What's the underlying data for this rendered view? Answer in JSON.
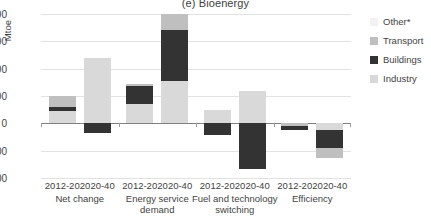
{
  "chart_data": {
    "type": "bar",
    "title": "(e) Bioenergy",
    "subtitle": "",
    "xlabel": "",
    "ylabel": "Mtoe",
    "ylim": [
      -200,
      400
    ],
    "yticks": [
      400,
      300,
      200,
      100,
      0,
      -100,
      -200
    ],
    "ytick_labels": [
      "400",
      "300",
      "200",
      "100",
      "0",
      "-100",
      "-200"
    ],
    "grid": true,
    "stacked": true,
    "legend_position": "right",
    "legend": [
      "Other*",
      "Transport",
      "Buildings",
      "Industry"
    ],
    "colors": {
      "Other*": "#f2f2f2",
      "Transport": "#bfbfbf",
      "Buildings": "#333333",
      "Industry": "#d9d9d9"
    },
    "groups": [
      {
        "label": "Net change",
        "periods": [
          "2012-20",
          "2020-40"
        ]
      },
      {
        "label": "Energy service demand",
        "periods": [
          "2012-20",
          "2020-40"
        ]
      },
      {
        "label": "Fuel and technology switching",
        "periods": [
          "2012-20",
          "2020-40"
        ]
      },
      {
        "label": "Efficiency",
        "periods": [
          "2012-20",
          "2020-40"
        ]
      }
    ],
    "categories": [
      "Net change 2012-20",
      "Net change 2020-40",
      "Energy service demand 2012-20",
      "Energy service demand 2020-40",
      "Fuel and technology switching 2012-20",
      "Fuel and technology switching 2020-40",
      "Efficiency 2012-20",
      "Efficiency 2020-40"
    ],
    "series": [
      {
        "name": "Industry",
        "values": [
          48,
          230,
          70,
          155,
          50,
          120,
          0,
          -25
        ]
      },
      {
        "name": "Buildings",
        "values": [
          15,
          -35,
          70,
          185,
          -40,
          -165,
          -25,
          -65
        ]
      },
      {
        "name": "Transport",
        "values": [
          37,
          10,
          0,
          60,
          0,
          0,
          0,
          -35
        ]
      },
      {
        "name": "Other*",
        "values": [
          0,
          0,
          0,
          0,
          0,
          0,
          0,
          0
        ]
      }
    ],
    "bar_segments": [
      {
        "category": "Net change 2012-20",
        "segments": [
          {
            "series": "Industry",
            "from": 0,
            "to": 45
          },
          {
            "series": "Buildings",
            "from": 45,
            "to": 60
          },
          {
            "series": "Transport",
            "from": 60,
            "to": 100
          }
        ]
      },
      {
        "category": "Net change 2020-40",
        "segments": [
          {
            "series": "Industry",
            "from": 0,
            "to": 240
          },
          {
            "series": "Buildings",
            "from": 0,
            "to": -37
          }
        ]
      },
      {
        "category": "Energy service demand 2012-20",
        "segments": [
          {
            "series": "Industry",
            "from": 0,
            "to": 70
          },
          {
            "series": "Buildings",
            "from": 70,
            "to": 135
          },
          {
            "series": "Transport",
            "from": 135,
            "to": 143
          }
        ]
      },
      {
        "category": "Energy service demand 2020-40",
        "segments": [
          {
            "series": "Industry",
            "from": 0,
            "to": 155
          },
          {
            "series": "Buildings",
            "from": 155,
            "to": 340
          },
          {
            "series": "Transport",
            "from": 340,
            "to": 400
          }
        ]
      },
      {
        "category": "Fuel and technology switching 2012-20",
        "segments": [
          {
            "series": "Industry",
            "from": 0,
            "to": 50
          },
          {
            "series": "Buildings",
            "from": 0,
            "to": -42
          }
        ]
      },
      {
        "category": "Fuel and technology switching 2020-40",
        "segments": [
          {
            "series": "Industry",
            "from": 0,
            "to": 120
          },
          {
            "series": "Buildings",
            "from": 0,
            "to": -168
          }
        ]
      },
      {
        "category": "Efficiency 2012-20",
        "segments": [
          {
            "series": "Transport",
            "from": 0,
            "to": -8
          },
          {
            "series": "Buildings",
            "from": -8,
            "to": -24
          }
        ]
      },
      {
        "category": "Efficiency 2020-40",
        "segments": [
          {
            "series": "Industry",
            "from": 0,
            "to": -26
          },
          {
            "series": "Buildings",
            "from": -26,
            "to": -90
          },
          {
            "series": "Transport",
            "from": -90,
            "to": -126
          }
        ]
      }
    ]
  }
}
